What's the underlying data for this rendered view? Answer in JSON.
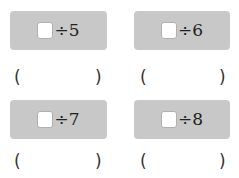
{
  "problems": [
    {
      "operator": "÷",
      "divisor": "5",
      "open_paren": "(",
      "close_paren": ")",
      "answer": ""
    },
    {
      "operator": "÷",
      "divisor": "6",
      "open_paren": "(",
      "close_paren": ")",
      "answer": ""
    },
    {
      "operator": "÷",
      "divisor": "7",
      "open_paren": "(",
      "close_paren": ")",
      "answer": ""
    },
    {
      "operator": "÷",
      "divisor": "8",
      "open_paren": "(",
      "close_paren": ")",
      "answer": ""
    }
  ]
}
